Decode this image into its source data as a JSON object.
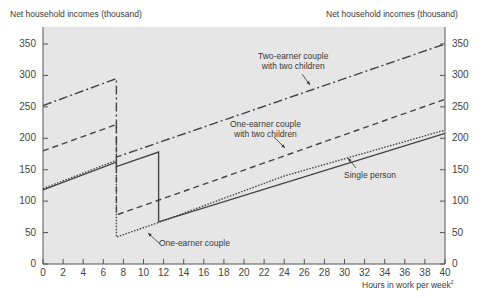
{
  "chart_data": {
    "type": "line",
    "title": "",
    "ylabel_left": "Net household incomes (thousand)",
    "ylabel_right": "Net household incomes (thousand)",
    "xlabel": "Hours in work per week",
    "xlabel_superscript": "2",
    "xlim": [
      0,
      40
    ],
    "ylim": [
      0,
      370
    ],
    "x_ticks": [
      0,
      2,
      4,
      6,
      8,
      10,
      12,
      14,
      16,
      18,
      20,
      22,
      24,
      26,
      28,
      30,
      32,
      34,
      36,
      38,
      40
    ],
    "y_ticks": [
      0,
      50,
      100,
      150,
      200,
      250,
      300,
      350
    ],
    "grid": false,
    "background": "#e6e6e6",
    "series": [
      {
        "name": "Two-earner couple with two children",
        "style": "dash-dot",
        "points": [
          [
            0,
            252
          ],
          [
            7.3,
            295
          ],
          [
            7.3,
            170
          ],
          [
            40,
            350
          ]
        ]
      },
      {
        "name": "One-earner couple with two children",
        "style": "dashed",
        "points": [
          [
            0,
            180
          ],
          [
            7.3,
            222
          ],
          [
            7.3,
            78
          ],
          [
            40,
            262
          ]
        ]
      },
      {
        "name": "Single person",
        "style": "solid",
        "points": [
          [
            0,
            118
          ],
          [
            7.3,
            162
          ],
          [
            7.3,
            155
          ],
          [
            11.5,
            178
          ],
          [
            11.5,
            67
          ],
          [
            40,
            208
          ]
        ]
      },
      {
        "name": "One-earner couple",
        "style": "dotted",
        "points": [
          [
            0,
            120
          ],
          [
            7.3,
            165
          ],
          [
            7.3,
            43
          ],
          [
            11.5,
            66
          ],
          [
            24,
            140
          ],
          [
            40,
            213
          ]
        ]
      }
    ],
    "annotations": [
      {
        "text": "Two-earner couple\nwith two children",
        "series": "Two-earner couple with two children"
      },
      {
        "text": "One-earner couple\nwith two children",
        "series": "One-earner couple with two children"
      },
      {
        "text": "Single person",
        "series": "Single person"
      },
      {
        "text": "One-earner couple",
        "series": "One-earner couple"
      }
    ]
  },
  "labels": {
    "y_left": "Net household incomes (thousand)",
    "y_right": "Net household incomes (thousand)",
    "x": "Hours in work per week",
    "x_sup": "2",
    "ann_two_earner_1": "Two-earner couple",
    "ann_two_earner_2": "with two children",
    "ann_one_earner_kids_1": "One-earner couple",
    "ann_one_earner_kids_2": "with two children",
    "ann_single": "Single person",
    "ann_one_earner": "One-earner couple"
  }
}
